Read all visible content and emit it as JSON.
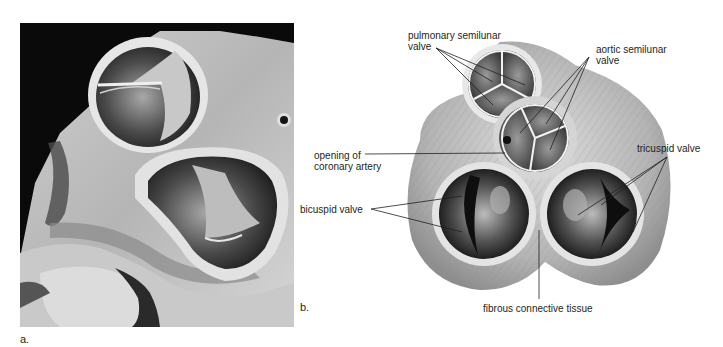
{
  "figure": {
    "panels": [
      {
        "id": "a",
        "label": "a.",
        "type": "photograph"
      },
      {
        "id": "b",
        "label": "b.",
        "type": "illustration"
      }
    ],
    "labels": {
      "pulmonary_line1": "pulmonary semilunar",
      "pulmonary_line2": "valve",
      "aortic_line1": "aortic semilunar",
      "aortic_line2": "valve",
      "coronary_line1": "opening of",
      "coronary_line2": "coronary artery",
      "tricuspid": "tricuspid valve",
      "bicuspid": "bicuspid valve",
      "fibrous": "fibrous connective tissue"
    },
    "colors": {
      "background": "#ffffff",
      "text": "#231f20",
      "photo_bg": "#0a0a0a",
      "tissue_light": "#d9d9d9",
      "tissue_mid": "#9a9a9a",
      "valve_dark": "#1a1a1a"
    }
  }
}
